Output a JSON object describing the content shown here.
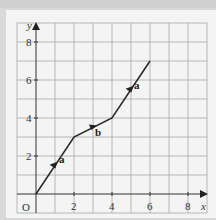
{
  "diagram": {
    "type": "vector-path-on-grid",
    "axes": {
      "x_label": "x",
      "y_label": "y",
      "origin_label": "O",
      "x_ticks": [
        "2",
        "4",
        "6",
        "8"
      ],
      "y_ticks": [
        "2",
        "4",
        "6",
        "8"
      ],
      "x_range": [
        -1,
        9
      ],
      "y_range": [
        -1,
        9
      ]
    },
    "path_points": [
      [
        0,
        0
      ],
      [
        2,
        3
      ],
      [
        4,
        4
      ],
      [
        6,
        7
      ]
    ],
    "vectors": [
      {
        "label": "a",
        "from": [
          0,
          0
        ],
        "to": [
          2,
          3
        ]
      },
      {
        "label": "b",
        "from": [
          2,
          3
        ],
        "to": [
          4,
          4
        ]
      },
      {
        "label": "a",
        "from": [
          4,
          4
        ],
        "to": [
          6,
          7
        ]
      }
    ],
    "colors": {
      "grid": "#9a9a9a",
      "axis": "#333333",
      "path": "#2a2a2a",
      "background": "#f4f4f4"
    }
  }
}
